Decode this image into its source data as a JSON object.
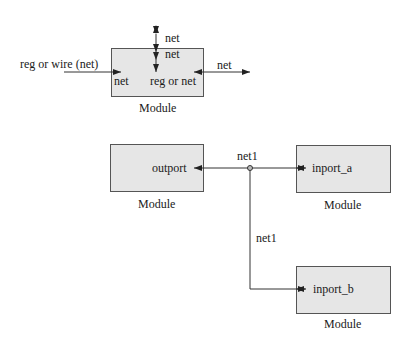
{
  "colors": {
    "box_fill": "#e6e6e6",
    "box_border": "#555555",
    "line": "#333333",
    "text": "#1a1a1a"
  },
  "top_diagram": {
    "module_label": "Module",
    "input_outside_label": "reg or wire (net)",
    "input_inside_label": "net",
    "inout_outside_label": "net",
    "inout_inside_label": "net",
    "output_inside_label": "reg or net",
    "output_outside_label": "net"
  },
  "bottom_diagram": {
    "source_module": {
      "label": "Module",
      "port": "outport"
    },
    "net_label_horizontal": "net1",
    "net_label_vertical": "net1",
    "sink_module_a": {
      "label": "Module",
      "port": "inport_a"
    },
    "sink_module_b": {
      "label": "Module",
      "port": "inport_b"
    }
  }
}
